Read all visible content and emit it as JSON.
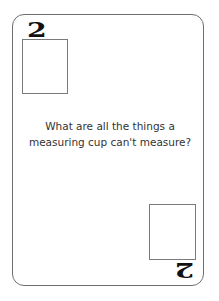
{
  "card": {
    "rank": "2",
    "prompt_line1": "What are all the things a",
    "prompt_line2": "measuring cup can't measure?",
    "border_color": "#6e6e6e",
    "text_color": "#333333"
  }
}
